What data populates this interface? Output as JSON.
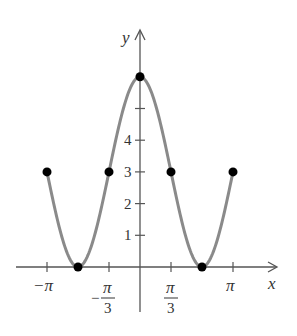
{
  "chart_data": {
    "type": "line",
    "title": "",
    "xlabel": "x",
    "ylabel": "y",
    "function": "y = 3 + 3cos(3x/2)",
    "xlim": [
      -3.6,
      4.5
    ],
    "ylim": [
      -1.5,
      7.2
    ],
    "x_ticks": [
      {
        "value": -3.14159,
        "label": "−π"
      },
      {
        "value": -1.0472,
        "label": "−π/3"
      },
      {
        "value": 1.0472,
        "label": "π/3"
      },
      {
        "value": 3.14159,
        "label": "π"
      }
    ],
    "y_ticks": [
      {
        "value": 1,
        "label": "1"
      },
      {
        "value": 2,
        "label": "2"
      },
      {
        "value": 3,
        "label": "3"
      },
      {
        "value": 4,
        "label": "4"
      },
      {
        "value": 5,
        "label": ""
      }
    ],
    "points": [
      {
        "x": -3.14159,
        "y": 3
      },
      {
        "x": -2.0944,
        "y": 0
      },
      {
        "x": -1.0472,
        "y": 3
      },
      {
        "x": 0,
        "y": 6
      },
      {
        "x": 1.0472,
        "y": 3
      },
      {
        "x": 2.0944,
        "y": 0
      },
      {
        "x": 3.14159,
        "y": 3
      }
    ],
    "grid": false,
    "legend": null
  },
  "labels": {
    "x_axis": "x",
    "y_axis": "y",
    "neg_pi": "−π",
    "pi": "π",
    "neg_pi_third_sign": "−",
    "pi_sym": "π",
    "three": "3",
    "y1": "1",
    "y2": "2",
    "y3": "3",
    "y4": "4"
  },
  "colors": {
    "curve": "#8a8a8a",
    "axis": "#555555",
    "dot": "#000000"
  }
}
